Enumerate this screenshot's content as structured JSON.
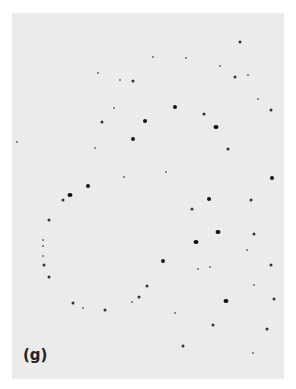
{
  "figure": {
    "label": "(g)",
    "background_color": "#ebebeb",
    "dot_color": "#151515",
    "dots": [
      {
        "x": 240,
        "y": 42,
        "size": "m"
      },
      {
        "x": 153,
        "y": 57,
        "size": "s"
      },
      {
        "x": 186,
        "y": 58,
        "size": "s"
      },
      {
        "x": 220,
        "y": 66,
        "size": "s"
      },
      {
        "x": 235,
        "y": 77,
        "size": "m"
      },
      {
        "x": 248,
        "y": 75,
        "size": "s"
      },
      {
        "x": 133,
        "y": 81,
        "size": "m"
      },
      {
        "x": 120,
        "y": 80,
        "size": "s"
      },
      {
        "x": 98,
        "y": 73,
        "size": "s"
      },
      {
        "x": 175,
        "y": 107,
        "size": "l"
      },
      {
        "x": 204,
        "y": 114,
        "size": "m"
      },
      {
        "x": 271,
        "y": 110,
        "size": "m"
      },
      {
        "x": 258,
        "y": 99,
        "size": "s"
      },
      {
        "x": 102,
        "y": 122,
        "size": "m"
      },
      {
        "x": 145,
        "y": 121,
        "size": "l"
      },
      {
        "x": 216,
        "y": 127,
        "size": "xl"
      },
      {
        "x": 228,
        "y": 149,
        "size": "m"
      },
      {
        "x": 133,
        "y": 139,
        "size": "l"
      },
      {
        "x": 114,
        "y": 108,
        "size": "s"
      },
      {
        "x": 95,
        "y": 148,
        "size": "s"
      },
      {
        "x": 166,
        "y": 172,
        "size": "s"
      },
      {
        "x": 272,
        "y": 178,
        "size": "l"
      },
      {
        "x": 17,
        "y": 142,
        "size": "s"
      },
      {
        "x": 124,
        "y": 177,
        "size": "s"
      },
      {
        "x": 88,
        "y": 186,
        "size": "l"
      },
      {
        "x": 70,
        "y": 195,
        "size": "xl"
      },
      {
        "x": 63,
        "y": 200,
        "size": "m"
      },
      {
        "x": 209,
        "y": 199,
        "size": "l"
      },
      {
        "x": 251,
        "y": 200,
        "size": "m"
      },
      {
        "x": 192,
        "y": 209,
        "size": "m"
      },
      {
        "x": 218,
        "y": 232,
        "size": "xl"
      },
      {
        "x": 254,
        "y": 234,
        "size": "m"
      },
      {
        "x": 196,
        "y": 242,
        "size": "xl"
      },
      {
        "x": 49,
        "y": 220,
        "size": "m"
      },
      {
        "x": 43,
        "y": 240,
        "size": "s"
      },
      {
        "x": 43,
        "y": 246,
        "size": "s"
      },
      {
        "x": 43,
        "y": 256,
        "size": "s"
      },
      {
        "x": 44,
        "y": 265,
        "size": "m"
      },
      {
        "x": 49,
        "y": 277,
        "size": "m"
      },
      {
        "x": 163,
        "y": 261,
        "size": "l"
      },
      {
        "x": 247,
        "y": 250,
        "size": "s"
      },
      {
        "x": 271,
        "y": 265,
        "size": "m"
      },
      {
        "x": 198,
        "y": 269,
        "size": "s"
      },
      {
        "x": 210,
        "y": 267,
        "size": "s"
      },
      {
        "x": 226,
        "y": 301,
        "size": "xl"
      },
      {
        "x": 254,
        "y": 285,
        "size": "s"
      },
      {
        "x": 274,
        "y": 299,
        "size": "m"
      },
      {
        "x": 147,
        "y": 286,
        "size": "m"
      },
      {
        "x": 139,
        "y": 297,
        "size": "m"
      },
      {
        "x": 132,
        "y": 302,
        "size": "s"
      },
      {
        "x": 73,
        "y": 303,
        "size": "m"
      },
      {
        "x": 83,
        "y": 308,
        "size": "s"
      },
      {
        "x": 105,
        "y": 310,
        "size": "m"
      },
      {
        "x": 175,
        "y": 313,
        "size": "s"
      },
      {
        "x": 213,
        "y": 325,
        "size": "m"
      },
      {
        "x": 267,
        "y": 329,
        "size": "m"
      },
      {
        "x": 183,
        "y": 346,
        "size": "m"
      },
      {
        "x": 253,
        "y": 353,
        "size": "s"
      }
    ]
  }
}
